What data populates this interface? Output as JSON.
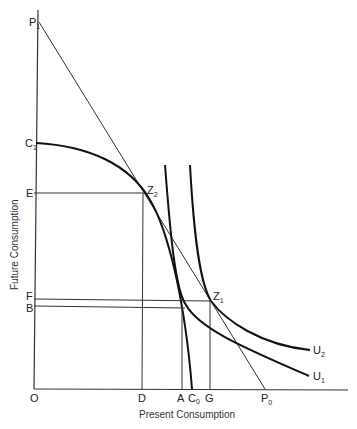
{
  "diagram": {
    "x_axis_title": "Present Consumption",
    "y_axis_title": "Future Consumption",
    "labels": {
      "origin": "O",
      "P1": {
        "main": "P",
        "sub": "1"
      },
      "C1": {
        "main": "C",
        "sub": "1"
      },
      "E": "E",
      "F": "F",
      "B": "B",
      "Z2": {
        "main": "Z",
        "sub": "2"
      },
      "Z1": {
        "main": "Z",
        "sub": "1"
      },
      "D": "D",
      "A": "A",
      "C0": {
        "main": "C",
        "sub": "0"
      },
      "G": "G",
      "P0": {
        "main": "P",
        "sub": "0"
      },
      "U1": {
        "main": "U",
        "sub": "1"
      },
      "U2": {
        "main": "U",
        "sub": "2"
      }
    },
    "colors": {
      "line": "#333333",
      "curve": "#111111",
      "text": "#222222"
    }
  }
}
